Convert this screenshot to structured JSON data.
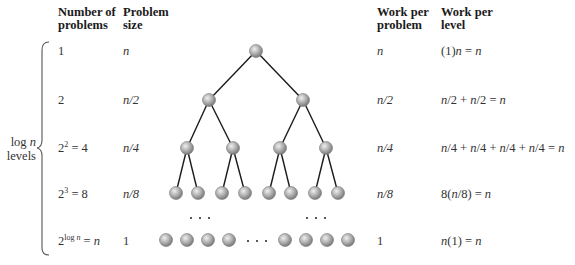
{
  "headers": {
    "num_problems": [
      "Number of",
      "problems"
    ],
    "problem_size": [
      "Problem",
      "size"
    ],
    "work_per_problem": [
      "Work per",
      "problem"
    ],
    "work_per_level": [
      "Work per",
      "level"
    ]
  },
  "side_label": {
    "line1": "log n",
    "line2": "levels"
  },
  "rows": [
    {
      "num": "1",
      "size": "n",
      "wpp": "n",
      "wpl": "(1)n = n"
    },
    {
      "num": "2",
      "size": "n/2",
      "wpp": "n/2",
      "wpl": "n/2 + n/2 = n"
    },
    {
      "num": "2^2 = 4",
      "size": "n/4",
      "wpp": "n/4",
      "wpl": "n/4 + n/4 + n/4 + n/4 = n"
    },
    {
      "num": "2^3 = 8",
      "size": "n/8",
      "wpp": "n/8",
      "wpl": "8(n/8) = n"
    },
    {
      "num": "2^(log n) = n",
      "size": "1",
      "wpp": "1",
      "wpl": "n(1) = n"
    }
  ],
  "tree": {
    "levels": 4,
    "leaf_row_nodes_left": 4,
    "leaf_row_nodes_right": 4,
    "ellipsis": "· · ·",
    "node_color": "#a8a8a8",
    "edge_color": "#1a1a1a"
  }
}
